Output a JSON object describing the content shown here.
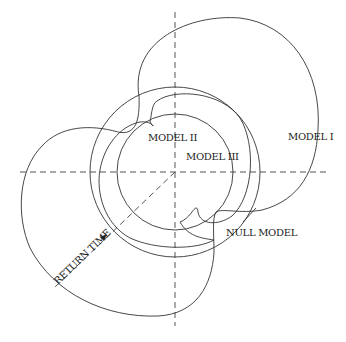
{
  "labels": {
    "model_1": "MODEL I",
    "model_2": "MODEL II",
    "model_3": "MODEL III",
    "null_model": "NULL MODEL",
    "return_time": "RETURN TIME"
  },
  "colors": {
    "curve": "#333333",
    "axis": "#555555",
    "background": "#ffffff"
  },
  "figure": {
    "type": "polar return-time diagram",
    "axes": [
      "horizontal dashed axis",
      "vertical dashed axis",
      "diagonal dashed radius"
    ],
    "curves": [
      "MODEL I",
      "MODEL II",
      "MODEL III",
      "NULL MODEL"
    ]
  }
}
